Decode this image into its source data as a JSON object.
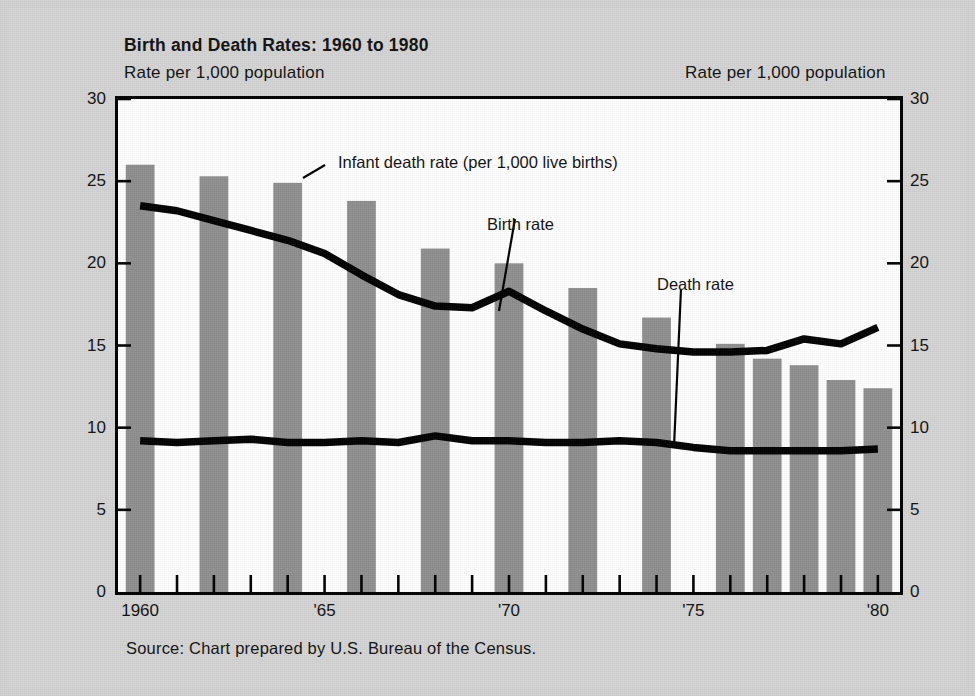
{
  "figure": {
    "background_color": "#d4d4d4",
    "plot_background_color": "#ffffff",
    "bar_color": "#8f8f8f",
    "line_color": "#000000"
  },
  "header": {
    "title": "Birth and Death Rates:  1960 to 1980",
    "subtitle_left": "Rate per 1,000 population",
    "subtitle_right": "Rate per 1,000 population"
  },
  "footer": {
    "source": "Source:  Chart prepared by U.S. Bureau of the Census."
  },
  "annotations": {
    "infant": "Infant death rate (per 1,000 live births)",
    "birth": "Birth rate",
    "death": "Death rate"
  },
  "axis": {
    "y_ticks": [
      "0",
      "5",
      "10",
      "15",
      "20",
      "25",
      "30"
    ],
    "x_tick_labels": [
      {
        "year": 1960,
        "label": "1960"
      },
      {
        "year": 1965,
        "label": "'65"
      },
      {
        "year": 1970,
        "label": "'70"
      },
      {
        "year": 1975,
        "label": "'75"
      },
      {
        "year": 1980,
        "label": "'80"
      }
    ]
  },
  "chart_data": {
    "type": "bar",
    "title": "Birth and Death Rates:  1960 to 1980",
    "xlabel": "",
    "ylabel": "Rate per 1,000 population",
    "ylim": [
      0,
      30
    ],
    "xlim": [
      1959.4,
      1980.6
    ],
    "grid": false,
    "legend": "inline-annotations",
    "y_ticks": [
      0,
      5,
      10,
      15,
      20,
      25,
      30
    ],
    "x_ticks": [
      1960,
      1961,
      1962,
      1963,
      1964,
      1965,
      1966,
      1967,
      1968,
      1969,
      1970,
      1971,
      1972,
      1973,
      1974,
      1975,
      1976,
      1977,
      1978,
      1979,
      1980
    ],
    "bars": {
      "name": "Birth rate",
      "color": "#8f8f8f",
      "note": "Bars plotted for every other year",
      "categories": [
        1960,
        1962,
        1964,
        1966,
        1968,
        1970,
        1972,
        1974,
        1976,
        1977,
        1978,
        1979,
        1980
      ],
      "values": [
        26.0,
        25.3,
        24.9,
        23.8,
        20.9,
        20.0,
        18.5,
        16.7,
        15.1,
        14.2,
        13.8,
        12.9,
        12.4
      ]
    },
    "series": [
      {
        "name": "Infant death rate (per 1,000 live births)",
        "type": "line",
        "color": "#000000",
        "x": [
          1960,
          1961,
          1962,
          1963,
          1964,
          1965,
          1966,
          1967,
          1968,
          1969,
          1970,
          1971,
          1972,
          1973,
          1974,
          1975,
          1976,
          1977,
          1978,
          1979,
          1980
        ],
        "values": [
          23.5,
          23.2,
          22.6,
          22.0,
          21.4,
          20.6,
          19.3,
          18.1,
          17.4,
          17.3,
          18.3,
          17.1,
          16.0,
          15.1,
          14.8,
          14.6,
          14.6,
          14.7,
          15.4,
          15.1,
          16.1
        ]
      },
      {
        "name": "Death rate",
        "type": "line",
        "color": "#000000",
        "x": [
          1960,
          1961,
          1962,
          1963,
          1964,
          1965,
          1966,
          1967,
          1968,
          1969,
          1970,
          1971,
          1972,
          1973,
          1974,
          1975,
          1976,
          1977,
          1978,
          1979,
          1980
        ],
        "values": [
          9.2,
          9.1,
          9.2,
          9.3,
          9.1,
          9.1,
          9.2,
          9.1,
          9.5,
          9.2,
          9.2,
          9.1,
          9.1,
          9.2,
          9.1,
          8.8,
          8.6,
          8.6,
          8.6,
          8.6,
          8.7
        ]
      }
    ]
  }
}
